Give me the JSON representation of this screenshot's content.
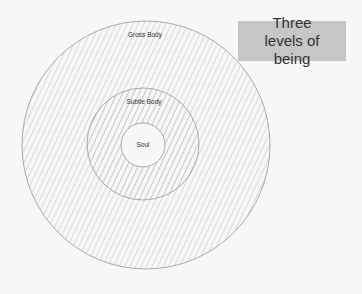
{
  "title": "Three levels of being",
  "levels": [
    {
      "label": "Gross Body"
    },
    {
      "label": "Subtle Body"
    },
    {
      "label": "Soul"
    }
  ],
  "colors": {
    "background": "#f7f7f7",
    "hatch": "#bdbdbd",
    "circle_stroke": "#aaaaaa",
    "title_box": "#c6c6c6"
  }
}
